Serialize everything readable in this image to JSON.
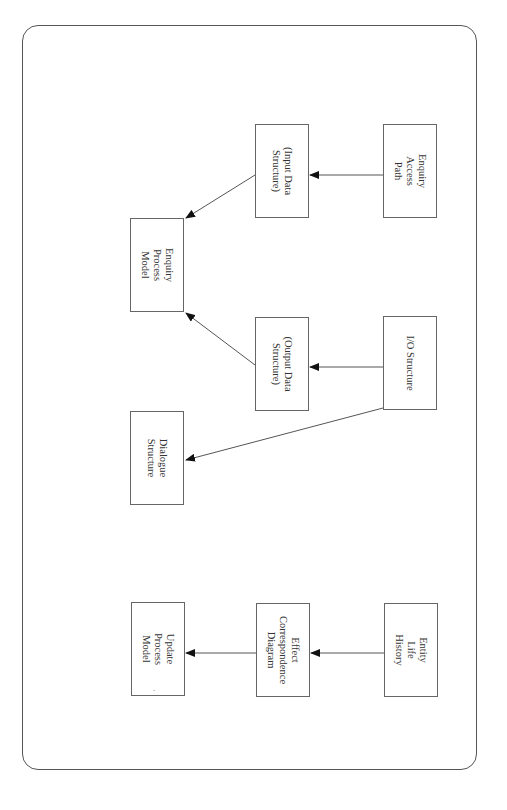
{
  "diagram": {
    "type": "flow",
    "orientation": "rotated-90-clockwise",
    "nodes": [
      {
        "id": "enquiry-access-path",
        "label": "Enquiry\nAccess\nPath"
      },
      {
        "id": "input-data-structure",
        "label": "(Input Data\nStructure)"
      },
      {
        "id": "enquiry-process-model",
        "label": "Enquiry\nProcess\nModel"
      },
      {
        "id": "io-structure",
        "label": "I/O Structure"
      },
      {
        "id": "output-data-structure",
        "label": "(Output Data\nStructure)"
      },
      {
        "id": "dialogue-structure",
        "label": "Dialogue\nStructure"
      },
      {
        "id": "entity-life-history",
        "label": "Entity\nLife\nHistory"
      },
      {
        "id": "effect-correspondence-diagram",
        "label": "Effect\nCorrespondence\nDiagram"
      },
      {
        "id": "update-process-model",
        "label": "Update\nProcess\nModel"
      }
    ],
    "edges": [
      {
        "from": "enquiry-access-path",
        "to": "input-data-structure"
      },
      {
        "from": "input-data-structure",
        "to": "enquiry-process-model"
      },
      {
        "from": "io-structure",
        "to": "output-data-structure"
      },
      {
        "from": "output-data-structure",
        "to": "enquiry-process-model"
      },
      {
        "from": "io-structure",
        "to": "dialogue-structure"
      },
      {
        "from": "entity-life-history",
        "to": "effect-correspondence-diagram"
      },
      {
        "from": "effect-correspondence-diagram",
        "to": "update-process-model"
      }
    ],
    "stray_mark": "."
  }
}
